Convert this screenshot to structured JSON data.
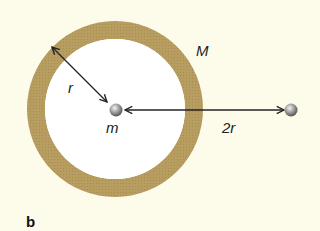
{
  "diagram": {
    "labels": {
      "shell_mass": "M",
      "radius": "r",
      "inner_mass": "m",
      "distance": "2r",
      "panel": "b"
    },
    "colors": {
      "background": "#fdfbe9",
      "shell": "#b59a5e",
      "interior": "#ffffff",
      "arrow": "#222222",
      "particle": "#8a8a8a"
    }
  }
}
